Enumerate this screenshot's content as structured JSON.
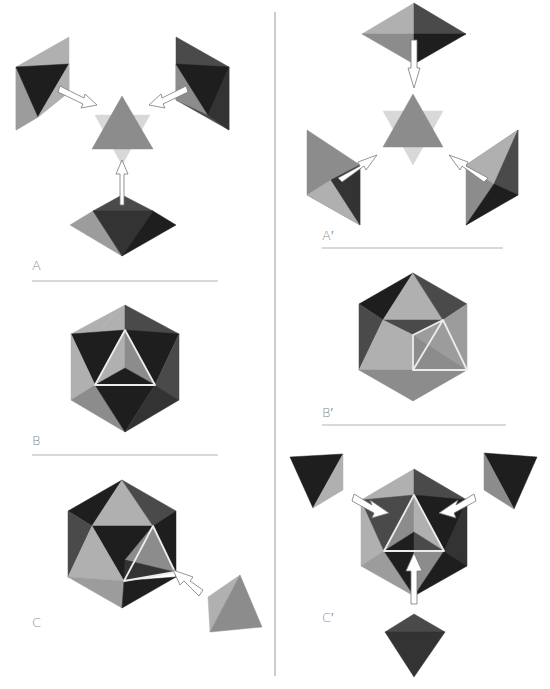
{
  "figure": {
    "colors": {
      "background": "#ffffff",
      "divider": "#9a9a9a",
      "rule": "#b4b4b4",
      "label": "#8a8a8a",
      "face_light": "#b0b0b0",
      "face_mid": "#8c8c8c",
      "face_midlight": "#9c9c9c",
      "face_dark": "#4a4a4a",
      "face_darker": "#333333",
      "face_black": "#1e1e1e",
      "ghost": "#d8d8d8",
      "edge_highlight": "#ececec"
    },
    "panels": [
      {
        "id": "A",
        "label": "A",
        "label_pos": [
          32,
          258
        ]
      },
      {
        "id": "A-prime",
        "label": "A′",
        "label_pos": [
          322,
          228
        ]
      },
      {
        "id": "B",
        "label": "B",
        "label_pos": [
          32,
          433
        ]
      },
      {
        "id": "B-prime",
        "label": "B′",
        "label_pos": [
          322,
          405
        ]
      },
      {
        "id": "C",
        "label": "C",
        "label_pos": [
          32,
          615
        ]
      },
      {
        "id": "C-prime",
        "label": "C′",
        "label_pos": [
          322,
          610
        ]
      }
    ],
    "divider": {
      "x": 275,
      "y1": 12,
      "y2": 676
    },
    "rules": [
      {
        "x1": 32,
        "x2": 218,
        "y": 281
      },
      {
        "x1": 322,
        "x2": 503,
        "y": 248
      },
      {
        "x1": 32,
        "x2": 218,
        "y": 455
      },
      {
        "x1": 322,
        "x2": 506,
        "y": 425
      }
    ],
    "shapes": [
      {
        "panel": "A",
        "name": "left-solid-back",
        "fill": "face_light",
        "pts": "69,37 69,92 38,117 16,130 16,67"
      },
      {
        "panel": "A",
        "name": "left-solid-lower",
        "fill": "face_midlight",
        "pts": "16,67 38,117 16,130"
      },
      {
        "panel": "A",
        "name": "left-solid-dark",
        "fill": "face_black",
        "pts": "16,67 69,64 38,117"
      },
      {
        "panel": "A",
        "name": "left-solid-right",
        "fill": "face_light",
        "pts": "69,64 69,92 38,117"
      },
      {
        "panel": "A",
        "name": "right-solid-back",
        "fill": "face_dark",
        "pts": "176,37 229,67 229,130 176,100"
      },
      {
        "panel": "A",
        "name": "right-solid-left",
        "fill": "face_mid",
        "pts": "176,64 176,100 208,115"
      },
      {
        "panel": "A",
        "name": "right-solid-dark",
        "fill": "face_black",
        "pts": "176,64 229,67 208,115"
      },
      {
        "panel": "A",
        "name": "right-solid-lower",
        "fill": "face_darker",
        "pts": "229,67 229,130 208,115"
      },
      {
        "panel": "A",
        "name": "ghost-star",
        "fill": "ghost",
        "pts": "95,115 150,115 122,165"
      },
      {
        "panel": "A",
        "name": "center-triangle",
        "fill": "face_mid",
        "pts": "122,96 153,149 92,149"
      },
      {
        "panel": "A",
        "name": "bottom-solid-top",
        "fill": "face_dark",
        "pts": "122,195 153,211 93,211"
      },
      {
        "panel": "A",
        "name": "bottom-solid-left",
        "fill": "face_midlight",
        "pts": "70,225 93,211 122,256"
      },
      {
        "panel": "A",
        "name": "bottom-solid-front",
        "fill": "face_darker",
        "pts": "93,211 153,211 122,256"
      },
      {
        "panel": "A",
        "name": "bottom-solid-right",
        "fill": "face_black",
        "pts": "153,211 176,225 122,256"
      },
      {
        "panel": "A-prime",
        "name": "top-solid-ul",
        "fill": "face_light",
        "pts": "414,3 362,34 414,34"
      },
      {
        "panel": "A-prime",
        "name": "top-solid-ur",
        "fill": "face_dark",
        "pts": "414,3 466,34 414,34"
      },
      {
        "panel": "A-prime",
        "name": "top-solid-ll",
        "fill": "face_mid",
        "pts": "362,34 414,34 414,64"
      },
      {
        "panel": "A-prime",
        "name": "top-solid-lr",
        "fill": "face_black",
        "pts": "466,34 414,34 414,64"
      },
      {
        "panel": "A-prime",
        "name": "ghost-star",
        "fill": "ghost",
        "pts": "383,111 443,111 413,165"
      },
      {
        "panel": "A-prime",
        "name": "center-triangle",
        "fill": "face_mid",
        "pts": "413,94 443,147 383,147"
      },
      {
        "panel": "A-prime",
        "name": "left-solid-main",
        "fill": "face_mid",
        "pts": "307,130 360,165 360,225 307,195"
      },
      {
        "panel": "A-prime",
        "name": "left-solid-lower",
        "fill": "face_light",
        "pts": "307,195 331,180 360,225"
      },
      {
        "panel": "A-prime",
        "name": "left-solid-dark",
        "fill": "face_darker",
        "pts": "331,180 360,165 360,225"
      },
      {
        "panel": "A-prime",
        "name": "right-solid-main",
        "fill": "face_mid",
        "pts": "518,130 518,195 466,225 466,165"
      },
      {
        "panel": "A-prime",
        "name": "right-solid-light",
        "fill": "face_light",
        "pts": "518,130 466,165 494,184"
      },
      {
        "panel": "A-prime",
        "name": "right-solid-dark",
        "fill": "face_dark",
        "pts": "518,130 518,195 494,184"
      },
      {
        "panel": "A-prime",
        "name": "right-solid-black",
        "fill": "face_black",
        "pts": "494,184 518,195 466,225"
      },
      {
        "panel": "B",
        "name": "hex-top-left",
        "fill": "face_light",
        "pts": "125,305 71,334 95,334"
      },
      {
        "panel": "B",
        "name": "hex-top-mid",
        "fill": "face_light",
        "pts": "125,305 95,334 125,330"
      },
      {
        "panel": "B",
        "name": "hex-top-right",
        "fill": "face_dark",
        "pts": "125,305 125,330 155,334 179,334"
      },
      {
        "panel": "B",
        "name": "hex-ul-dark",
        "fill": "face_black",
        "pts": "71,334 125,330 95,385"
      },
      {
        "panel": "B",
        "name": "hex-ur-dark",
        "fill": "face_black",
        "pts": "125,330 179,334 155,385"
      },
      {
        "panel": "B",
        "name": "hex-left",
        "fill": "face_light",
        "pts": "71,334 95,385 71,400"
      },
      {
        "panel": "B",
        "name": "hex-right",
        "fill": "face_dark",
        "pts": "179,334 179,400 155,385"
      },
      {
        "panel": "B",
        "name": "hex-ll",
        "fill": "face_mid",
        "pts": "71,400 95,385 125,432"
      },
      {
        "panel": "B",
        "name": "hex-bottom",
        "fill": "face_black",
        "pts": "95,385 155,385 125,432"
      },
      {
        "panel": "B",
        "name": "hex-lr",
        "fill": "face_darker",
        "pts": "155,385 179,400 125,432"
      },
      {
        "panel": "B",
        "name": "inner-left",
        "fill": "face_light",
        "pts": "125,330 95,385 125,368"
      },
      {
        "panel": "B",
        "name": "inner-right",
        "fill": "face_mid",
        "pts": "125,330 155,385 125,368"
      },
      {
        "panel": "B",
        "name": "inner-bottom",
        "fill": "face_black",
        "pts": "95,385 155,385 125,368"
      },
      {
        "panel": "B-prime",
        "name": "hex-ul",
        "fill": "face_black",
        "pts": "413,273 359,304 383,320"
      },
      {
        "panel": "B-prime",
        "name": "hex-top",
        "fill": "face_light",
        "pts": "413,273 383,320 443,320"
      },
      {
        "panel": "B-prime",
        "name": "hex-ur",
        "fill": "face_dark",
        "pts": "413,273 467,304 443,320"
      },
      {
        "panel": "B-prime",
        "name": "hex-left",
        "fill": "face_dark",
        "pts": "359,304 383,320 359,370"
      },
      {
        "panel": "B-prime",
        "name": "hex-mid-dark",
        "fill": "face_dark",
        "pts": "383,320 443,320 413,335"
      },
      {
        "panel": "B-prime",
        "name": "hex-mid-left",
        "fill": "face_light",
        "pts": "383,320 413,335 413,370 359,370"
      },
      {
        "panel": "B-prime",
        "name": "hex-mid-right",
        "fill": "face_midlight",
        "pts": "443,320 467,304 467,370 413,335"
      },
      {
        "panel": "B-prime",
        "name": "inner-lower",
        "fill": "face_mid",
        "pts": "413,335 467,370 413,370"
      },
      {
        "panel": "B-prime",
        "name": "hex-ll",
        "fill": "face_mid",
        "pts": "359,370 413,370 413,401"
      },
      {
        "panel": "B-prime",
        "name": "hex-lr",
        "fill": "face_mid",
        "pts": "413,370 467,370 413,401"
      },
      {
        "panel": "C",
        "name": "hex-ul",
        "fill": "face_black",
        "pts": "122,480 68,511 92,526"
      },
      {
        "panel": "C",
        "name": "hex-top",
        "fill": "face_light",
        "pts": "122,480 92,526 153,526"
      },
      {
        "panel": "C",
        "name": "hex-ur",
        "fill": "face_dark",
        "pts": "122,480 176,511 153,526"
      },
      {
        "panel": "C",
        "name": "hex-left",
        "fill": "face_dark",
        "pts": "68,511 92,526 68,577"
      },
      {
        "panel": "C",
        "name": "hex-center",
        "fill": "face_black",
        "pts": "92,526 153,526 124,581"
      },
      {
        "panel": "C",
        "name": "hex-right",
        "fill": "face_black",
        "pts": "153,526 176,511 176,577 175,572"
      },
      {
        "panel": "C",
        "name": "hex-midleft",
        "fill": "face_light",
        "pts": "92,526 124,581 68,577"
      },
      {
        "panel": "C",
        "name": "hole-face",
        "fill": "face_mid",
        "pts": "153,526 125,560 175,572"
      },
      {
        "panel": "C",
        "name": "hole-bottom",
        "fill": "face_darker",
        "pts": "125,560 175,572 124,581"
      },
      {
        "panel": "C",
        "name": "hex-ll",
        "fill": "face_midlight",
        "pts": "68,577 124,581 122,608"
      },
      {
        "panel": "C",
        "name": "hex-lr",
        "fill": "face_black",
        "pts": "124,581 176,577 122,608"
      },
      {
        "panel": "C",
        "name": "tetra-left",
        "fill": "face_light",
        "pts": "208,597 240,575 210,632"
      },
      {
        "panel": "C",
        "name": "tetra-right",
        "fill": "face_mid",
        "pts": "240,575 262,627 210,632"
      },
      {
        "panel": "C-prime",
        "name": "left-tetra-dark",
        "fill": "face_black",
        "pts": "290,457 343,454 313,508"
      },
      {
        "panel": "C-prime",
        "name": "left-tetra-light",
        "fill": "face_light",
        "pts": "343,454 343,490 313,508"
      },
      {
        "panel": "C-prime",
        "name": "right-tetra-dark",
        "fill": "face_black",
        "pts": "484,453 537,457 514,509"
      },
      {
        "panel": "C-prime",
        "name": "right-tetra-light",
        "fill": "face_mid",
        "pts": "484,453 484,490 514,509"
      },
      {
        "panel": "C-prime",
        "name": "hex-ul",
        "fill": "face_light",
        "pts": "414,469 361,500 384,500 414,495"
      },
      {
        "panel": "C-prime",
        "name": "hex-ur",
        "fill": "face_dark",
        "pts": "414,469 467,500 444,500 414,495"
      },
      {
        "panel": "C-prime",
        "name": "hex-left",
        "fill": "face_light",
        "pts": "361,500 384,551 361,566"
      },
      {
        "panel": "C-prime",
        "name": "hex-right",
        "fill": "face_darker",
        "pts": "467,500 467,566 444,551"
      },
      {
        "panel": "C-prime",
        "name": "hex-upper-left-dark",
        "fill": "face_dark",
        "pts": "361,500 414,495 384,551"
      },
      {
        "panel": "C-prime",
        "name": "hex-upper-right-dark",
        "fill": "face_black",
        "pts": "414,495 467,500 444,551"
      },
      {
        "panel": "C-prime",
        "name": "inner-left",
        "fill": "face_mid",
        "pts": "414,495 384,551 414,532"
      },
      {
        "panel": "C-prime",
        "name": "inner-right",
        "fill": "face_light",
        "pts": "414,495 444,551 414,532"
      },
      {
        "panel": "C-prime",
        "name": "inner-bottom-left",
        "fill": "face_black",
        "pts": "384,551 414,532 414,551"
      },
      {
        "panel": "C-prime",
        "name": "inner-bottom-right",
        "fill": "face_dark",
        "pts": "414,532 444,551 414,551"
      },
      {
        "panel": "C-prime",
        "name": "hex-ll",
        "fill": "face_midlight",
        "pts": "361,566 384,551 414,596"
      },
      {
        "panel": "C-prime",
        "name": "hex-bottom-left",
        "fill": "face_black",
        "pts": "384,551 414,551 414,596"
      },
      {
        "panel": "C-prime",
        "name": "hex-bottom-right",
        "fill": "face_mid",
        "pts": "414,551 444,551 414,596"
      },
      {
        "panel": "C-prime",
        "name": "hex-lr",
        "fill": "face_black",
        "pts": "444,551 467,566 414,596"
      },
      {
        "panel": "C-prime",
        "name": "bottom-tetra-top",
        "fill": "face_dark",
        "pts": "414,614 385,632 445,632"
      },
      {
        "panel": "C-prime",
        "name": "bottom-tetra-front",
        "fill": "face_darker",
        "pts": "385,632 445,632 414,677"
      }
    ],
    "highlight_edges": [
      {
        "panel": "B",
        "pts": "125,330 95,385 155,385"
      },
      {
        "panel": "B-prime",
        "pts": "443,320 413,370 467,370 443,320 413,335 413,370"
      },
      {
        "panel": "C",
        "pts": "153,526 124,581 175,572"
      },
      {
        "panel": "C-prime",
        "pts": "414,495 384,551 444,551"
      }
    ],
    "arrows": [
      {
        "panel": "A",
        "name": "arrow-left-to-center",
        "pts": "60,86 84,98 85,94 97,105 81,108 83,104 58,92"
      },
      {
        "panel": "A",
        "name": "arrow-right-to-center",
        "pts": "186,86 162,98 161,94 149,105 165,108 163,104 188,92"
      },
      {
        "panel": "A",
        "name": "arrow-bottom-to-center",
        "pts": "120,205 120,174 116,174 122,160 128,174 124,174 124,205"
      },
      {
        "panel": "A-prime",
        "name": "arrow-top-to-center",
        "pts": "411,40 411,68 408,68 414,88 420,68 417,68 417,40"
      },
      {
        "panel": "A-prime",
        "name": "arrow-left-to-center",
        "pts": "338,178 360,166 358,162 377,155 366,170 364,166 342,182"
      },
      {
        "panel": "A-prime",
        "name": "arrow-right-to-center",
        "pts": "488,178 466,166 468,162 449,155 460,170 462,166 484,182"
      },
      {
        "panel": "C",
        "name": "arrow-tetra-to-hole",
        "pts": "203,590 190,581 193,577 173,570 180,585 184,581 199,596"
      },
      {
        "panel": "C-prime",
        "name": "arrow-left-in",
        "pts": "354,494 372,505 370,500 389,513 372,518 374,513 352,501"
      },
      {
        "panel": "C-prime",
        "name": "arrow-right-in",
        "pts": "474,494 456,505 458,500 439,513 456,518 454,513 476,501"
      },
      {
        "panel": "C-prime",
        "name": "arrow-bottom-in",
        "pts": "411,604 411,571 406,571 414,553 422,571 417,571 417,604"
      }
    ]
  }
}
